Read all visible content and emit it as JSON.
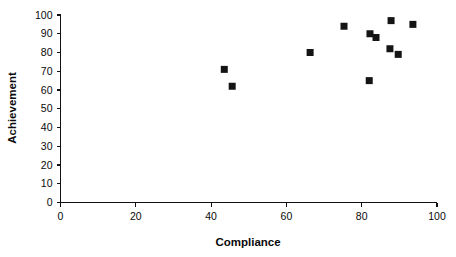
{
  "chart_data": {
    "type": "scatter",
    "title": "",
    "xlabel": "Compliance",
    "ylabel": "Achievement",
    "xlim": [
      0,
      100
    ],
    "ylim": [
      0,
      100
    ],
    "xticks": [
      0,
      20,
      40,
      60,
      80,
      100
    ],
    "yticks": [
      0,
      10,
      20,
      30,
      40,
      50,
      60,
      70,
      80,
      90,
      100
    ],
    "grid": false,
    "legend": null,
    "marker": "filled-square",
    "marker_color": "#141414",
    "series": [
      {
        "name": "observations",
        "points": [
          {
            "x": 43.5,
            "y": 71
          },
          {
            "x": 45.6,
            "y": 62
          },
          {
            "x": 66.3,
            "y": 80
          },
          {
            "x": 75.3,
            "y": 94
          },
          {
            "x": 82.0,
            "y": 65
          },
          {
            "x": 82.2,
            "y": 90
          },
          {
            "x": 83.8,
            "y": 88
          },
          {
            "x": 87.5,
            "y": 82
          },
          {
            "x": 87.8,
            "y": 97
          },
          {
            "x": 89.7,
            "y": 79
          },
          {
            "x": 93.6,
            "y": 95
          }
        ]
      }
    ]
  },
  "axes": {
    "x_title": "Compliance",
    "y_title": "Achievement",
    "x_tick_labels": [
      "0",
      "20",
      "40",
      "60",
      "80",
      "100"
    ],
    "y_tick_labels": [
      "0",
      "10",
      "20",
      "30",
      "40",
      "50",
      "60",
      "70",
      "80",
      "90",
      "100"
    ]
  }
}
